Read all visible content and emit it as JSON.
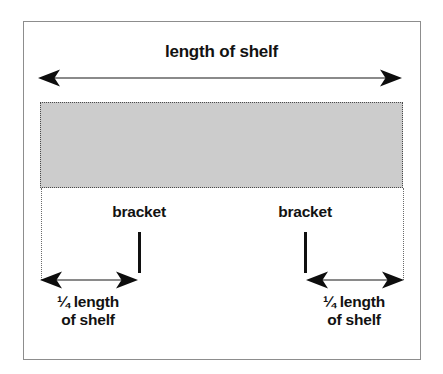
{
  "figure": {
    "title": "length of shelf",
    "background_color": "#ffffff",
    "frame_color": "#8d8d8d"
  },
  "shelf": {
    "fill_color": "#cccccc",
    "border_style": "dotted",
    "border_color": "#4a4a4a"
  },
  "dimensions": {
    "total": {
      "label": "length of shelf",
      "arrow": "double-headed"
    },
    "left_segment": {
      "line1": "¼ length",
      "line2": "of shelf",
      "arrow": "double-headed"
    },
    "right_segment": {
      "line1": "¼ length",
      "line2": "of shelf",
      "arrow": "double-headed"
    }
  },
  "brackets": [
    {
      "label": "bracket"
    },
    {
      "label": "bracket"
    }
  ],
  "colors": {
    "arrow_head": "#0d0d0d",
    "arrow_shaft": "#8a8a8a",
    "bracket_bar": "#101010",
    "guide_line": "#6b6b6b",
    "text": "#121212"
  }
}
